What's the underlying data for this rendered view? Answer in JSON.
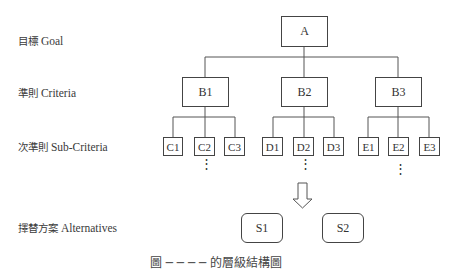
{
  "levels": [
    {
      "zh": "目標",
      "en": "Goal"
    },
    {
      "zh": "準則",
      "en": "Criteria"
    },
    {
      "zh": "次準則",
      "en": "Sub-Criteria"
    },
    {
      "zh": "擇替方案",
      "en": "Alternatives"
    }
  ],
  "goal": {
    "label": "A"
  },
  "criteria": [
    {
      "label": "B1"
    },
    {
      "label": "B2"
    },
    {
      "label": "B3"
    }
  ],
  "subcriteria": [
    {
      "label": "C1"
    },
    {
      "label": "C2"
    },
    {
      "label": "C3"
    },
    {
      "label": "D1"
    },
    {
      "label": "D2"
    },
    {
      "label": "D3"
    },
    {
      "label": "E1"
    },
    {
      "label": "E2"
    },
    {
      "label": "E3"
    }
  ],
  "ellipsis": "⋮",
  "alternatives": [
    {
      "label": "S1"
    },
    {
      "label": "S2"
    }
  ],
  "caption": "圖 ─ ─ ─ ─ 的層級結構圖"
}
